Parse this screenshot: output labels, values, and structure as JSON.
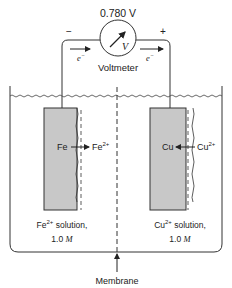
{
  "voltmeter": {
    "reading": "0.780 V",
    "symbol": "V",
    "label": "Voltmeter",
    "negative_terminal": "−",
    "positive_terminal": "+"
  },
  "electron_flow": {
    "left_label": "e",
    "right_label": "e",
    "charge": "−"
  },
  "left_cell": {
    "electrode": "Fe",
    "ion": "Fe",
    "ion_charge": "2+",
    "solution_ion": "Fe",
    "solution_charge": "2+",
    "solution_text": " solution,",
    "concentration": "1.0 ",
    "unit": "M"
  },
  "right_cell": {
    "electrode": "Cu",
    "ion": "Cu",
    "ion_charge": "2+",
    "solution_ion": "Cu",
    "solution_charge": "2+",
    "solution_text": " solution,",
    "concentration": "1.0 ",
    "unit": "M"
  },
  "membrane": {
    "label": "Membrane"
  },
  "colors": {
    "electrode_fill": "#c8c8c8",
    "line": "#333333"
  }
}
